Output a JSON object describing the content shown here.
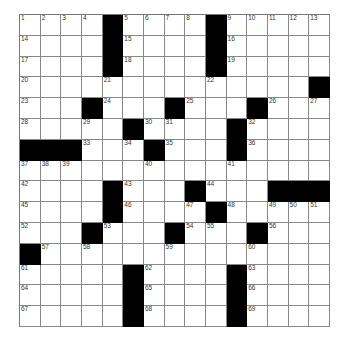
{
  "puzzle": {
    "size": 15,
    "rows": [
      [
        "1",
        "2",
        "3",
        "4",
        "#",
        "5",
        "6",
        "7",
        "8",
        "#",
        "9",
        "10",
        "11",
        "12",
        "13"
      ],
      [
        "14",
        "",
        "",
        "",
        "#",
        "15",
        "",
        "",
        "",
        "#",
        "16",
        "",
        "",
        "",
        ""
      ],
      [
        "17",
        "",
        "",
        "",
        "#",
        "18",
        "",
        "",
        "",
        "#",
        "19",
        "",
        "",
        "",
        ""
      ],
      [
        "20",
        "",
        "",
        "",
        "21",
        "",
        "",
        "",
        "",
        "22",
        "",
        "",
        "",
        "",
        "#"
      ],
      [
        "23",
        "",
        "",
        "#",
        "24",
        "",
        "",
        "#",
        "25",
        "",
        "",
        "#",
        "26",
        "",
        "27"
      ],
      [
        "28",
        "",
        "",
        "29",
        "",
        "#",
        "30",
        "31",
        "",
        "",
        "#",
        "32",
        "",
        "",
        ""
      ],
      [
        "#",
        "#",
        "#",
        "33",
        "",
        "34",
        "#",
        "35",
        "",
        "",
        "#",
        "36",
        "",
        "",
        ""
      ],
      [
        "37",
        "38",
        "39",
        "",
        "",
        "",
        "40",
        "",
        "",
        "",
        "41",
        "",
        "",
        "",
        ""
      ],
      [
        "42",
        "",
        "",
        "",
        "#",
        "43",
        "",
        "",
        "#",
        "44",
        "",
        "",
        "#",
        "#",
        "#"
      ],
      [
        "45",
        "",
        "",
        "",
        "#",
        "46",
        "",
        "",
        "47",
        "#",
        "48",
        "",
        "49",
        "50",
        "51"
      ],
      [
        "52",
        "",
        "",
        "#",
        "53",
        "",
        "",
        "#",
        "54",
        "55",
        "",
        "#",
        "56",
        "",
        ""
      ],
      [
        "#",
        "57",
        "",
        "58",
        "",
        "",
        "",
        "59",
        "",
        "",
        "",
        "60",
        "",
        "",
        ""
      ],
      [
        "61",
        "",
        "",
        "",
        "",
        "#",
        "62",
        "",
        "",
        "",
        "#",
        "63",
        "",
        "",
        ""
      ],
      [
        "64",
        "",
        "",
        "",
        "",
        "#",
        "65",
        "",
        "",
        "",
        "#",
        "66",
        "",
        "",
        ""
      ],
      [
        "67",
        "",
        "",
        "",
        "",
        "#",
        "68",
        "",
        "",
        "",
        "#",
        "69",
        "",
        "",
        ""
      ]
    ]
  }
}
